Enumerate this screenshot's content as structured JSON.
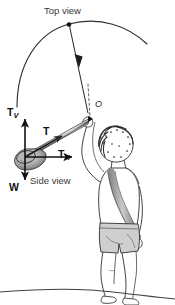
{
  "figure": {
    "title_top": "Top view",
    "title_side": "Side view",
    "origin_label": "O",
    "background_color": "#ffffff",
    "ink_color": "#1b1b1b"
  },
  "vectors": [
    {
      "id": "tension-vertical",
      "base": "T",
      "sub": "V",
      "direction": "up",
      "label": "T"
    },
    {
      "id": "tension",
      "base": "T",
      "sub": "",
      "direction": "along-sling",
      "label": "T"
    },
    {
      "id": "tension-horizontal",
      "base": "T",
      "sub": "H",
      "direction": "right",
      "label": "T"
    },
    {
      "id": "weight",
      "base": "W",
      "sub": "",
      "direction": "down",
      "label": "W"
    }
  ],
  "labels": {
    "tv_base": "T",
    "tv_sub": "V",
    "t_base": "T",
    "th_base": "T",
    "th_sub": "H",
    "w_base": "W"
  },
  "scene": {
    "subject": "person swinging a sling",
    "ground": "ground line",
    "sling_band": "sling strap",
    "projectile": "stone in sling pouch",
    "trajectory": "circular arc of sling path",
    "drop_line": "radius line from arc to centre O",
    "dashed_line": "dashed line from O down to hand"
  }
}
